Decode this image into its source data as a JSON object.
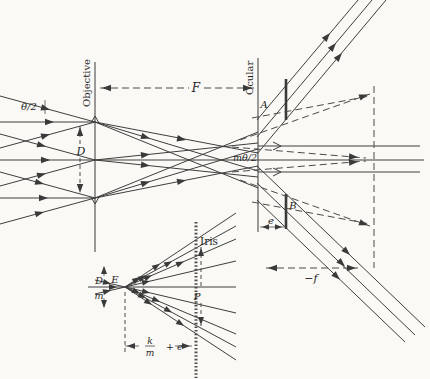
{
  "figure": {
    "background": "#faf9f6",
    "line_color": "#3e3e3e",
    "labels": {
      "objective": "Objective",
      "ocular": "Ocular",
      "F": "F",
      "theta_half": "θ/2",
      "D": "D",
      "m_theta_half": "mθ/2",
      "A": "A",
      "B": "B",
      "e": "e",
      "minus_f": "−f"
    },
    "inset": {
      "iris": "Iris",
      "E": "E",
      "P": "P",
      "dm_num": "D",
      "dm_den": "m",
      "km_num": "k",
      "km_den": "m",
      "km_suffix": "+ e"
    }
  }
}
